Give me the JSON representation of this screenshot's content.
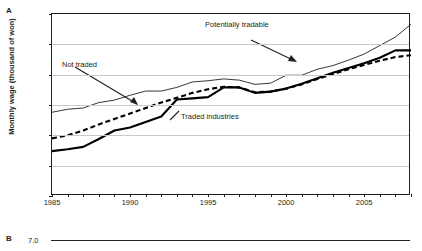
{
  "figure": {
    "panel_a_letter": "A",
    "panel_b_letter": "B"
  },
  "panel_a": {
    "ylabel": "Monthly wage (thousand of won)",
    "annotations": {
      "not_traded": "Not traded",
      "potentially_tradable": "Potentially tradable",
      "traded_industries": "Traded industries"
    }
  },
  "panel_b": {
    "first_ytick": "7.0"
  },
  "chart_data": {
    "type": "line",
    "title": "",
    "xlabel": "",
    "ylabel": "Monthly wage (thousand of won)",
    "xlim": [
      1985,
      2008
    ],
    "ylim": [
      0,
      3000
    ],
    "yticks": [
      0,
      500,
      1000,
      1500,
      2000,
      2500,
      3000
    ],
    "ytick_labels": [
      "0",
      "500",
      "1,000",
      "1,500",
      "2,000",
      "2,500",
      "3,000"
    ],
    "xticks": [
      1985,
      1986,
      1987,
      1988,
      1989,
      1990,
      1991,
      1992,
      1993,
      1994,
      1995,
      1996,
      1997,
      1998,
      1999,
      2000,
      2001,
      2002,
      2003,
      2004,
      2005,
      2006,
      2007,
      2008
    ],
    "xtick_labels_shown": [
      "1985",
      "1990",
      "1995",
      "2000",
      "2005"
    ],
    "xtick_labels_shown_at": [
      1985,
      1990,
      1995,
      2000,
      2005
    ],
    "grid": "horizontal",
    "legend": "annotations-with-arrows",
    "x": [
      1985,
      1986,
      1987,
      1988,
      1989,
      1990,
      1991,
      1992,
      1993,
      1994,
      1995,
      1996,
      1997,
      1998,
      1999,
      2000,
      2001,
      2002,
      2003,
      2004,
      2005,
      2006,
      2007,
      2008
    ],
    "series": [
      {
        "name": "Potentially tradable",
        "style": "thin-solid",
        "color": "#231f20",
        "values": [
          1380,
          1430,
          1450,
          1540,
          1580,
          1660,
          1730,
          1730,
          1790,
          1880,
          1900,
          1930,
          1910,
          1840,
          1860,
          1990,
          1990,
          2090,
          2150,
          2240,
          2340,
          2480,
          2620,
          2830
        ]
      },
      {
        "name": "Not traded",
        "style": "thick-dashed",
        "color": "#000000",
        "values": [
          950,
          1000,
          1080,
          1180,
          1270,
          1360,
          1450,
          1540,
          1620,
          1700,
          1760,
          1800,
          1790,
          1710,
          1720,
          1770,
          1840,
          1930,
          2010,
          2090,
          2160,
          2230,
          2290,
          2320
        ]
      },
      {
        "name": "Traded industries",
        "style": "thick-solid",
        "color": "#000000",
        "values": [
          740,
          770,
          810,
          940,
          1080,
          1130,
          1220,
          1310,
          1590,
          1610,
          1630,
          1790,
          1790,
          1700,
          1720,
          1770,
          1850,
          1940,
          2030,
          2110,
          2190,
          2280,
          2400,
          2400
        ]
      }
    ]
  }
}
